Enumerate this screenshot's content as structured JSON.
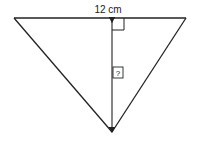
{
  "diagram": {
    "type": "triangle-height-problem",
    "base_label": "12 cm",
    "height_label": "?",
    "colors": {
      "stroke": "#222222",
      "background": "#ffffff"
    },
    "geometry": {
      "base_left": [
        14,
        18
      ],
      "base_right": [
        186,
        18
      ],
      "apex": [
        112,
        132
      ],
      "height_x": 112
    },
    "annotations": {
      "right_angle_marker": true,
      "double_arrow_height": true
    }
  }
}
